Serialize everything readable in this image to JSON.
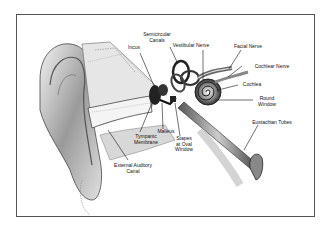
{
  "diagram": {
    "labels": [
      {
        "id": "semicircular-canals",
        "text": "Semicircular\nCanals",
        "x": 155,
        "y": 34
      },
      {
        "id": "incus",
        "text": "Incus",
        "x": 133,
        "y": 47
      },
      {
        "id": "vestibular-nerve",
        "text": "Vestibular Nerve",
        "x": 184,
        "y": 45
      },
      {
        "id": "facial-nerve",
        "text": "Facial Nerve",
        "x": 236,
        "y": 46
      },
      {
        "id": "cochlear-nerve",
        "text": "Cochlear Nerve",
        "x": 251,
        "y": 64
      },
      {
        "id": "cochlea",
        "text": "Cochlea",
        "x": 241,
        "y": 83
      },
      {
        "id": "round-window",
        "text": "Round\nWindow",
        "x": 258,
        "y": 97
      },
      {
        "id": "eustachian-tubes",
        "text": "Eustachian Tubes",
        "x": 249,
        "y": 121
      },
      {
        "id": "malleus",
        "text": "Malleus",
        "x": 157,
        "y": 130
      },
      {
        "id": "tympanic-membrane",
        "text": "Tympanic\nMembrane",
        "x": 136,
        "y": 134
      },
      {
        "id": "stapes-at-oval-window",
        "text": "Stapes\nat Oval\nWindow",
        "x": 175,
        "y": 137
      },
      {
        "id": "external-auditory-canal",
        "text": "External Auditory\nCanal",
        "x": 115,
        "y": 164
      }
    ]
  }
}
